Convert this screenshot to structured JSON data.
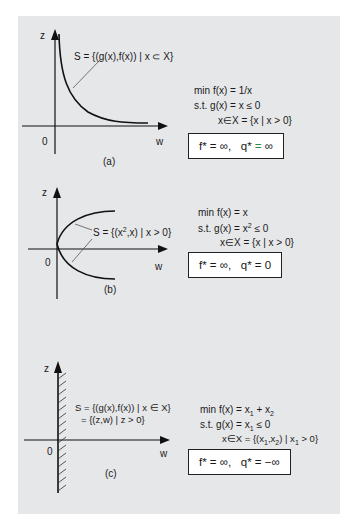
{
  "figure": {
    "background_color": "#e6e7e9",
    "accent_green": "#2e8b3a",
    "panels": [
      {
        "id": "a",
        "caption": "(a)",
        "axis_labels": {
          "vertical": "z",
          "horizontal": "w",
          "origin": "0"
        },
        "set_label": "S = {(g(x),f(x)) | x ⊂ X}",
        "curve": "hyperbola z = 1/w for w > 0",
        "problem": {
          "objective": "min  f(x) = 1/x",
          "constraint": "s.t.  g(x) = x  ≤ 0",
          "domain": "x∈X = {x | x > 0}"
        },
        "result": {
          "f_star": "f* = ∞,",
          "q_star_lhs": "q*",
          "q_star_eq": "=",
          "q_star_val": "∞"
        }
      },
      {
        "id": "b",
        "caption": "(b)",
        "axis_labels": {
          "vertical": "z",
          "horizontal": "w",
          "origin": "0"
        },
        "set_label_prefix": "S = {(x",
        "set_label_sup": "2",
        "set_label_suffix": ",x) | x > 0}",
        "curve": "parabola w = z², both branches",
        "problem": {
          "objective": "min  f(x) = x",
          "constraint_prefix": "s.t.  g(x) = x",
          "constraint_sup": "2",
          "constraint_suffix": " ≤ 0",
          "domain": "x∈X = {x | x > 0}"
        },
        "result": {
          "f_star": "f* = ∞,",
          "q_star": "q* = 0"
        }
      },
      {
        "id": "c",
        "caption": "(c)",
        "axis_labels": {
          "vertical": "z",
          "horizontal": "w",
          "origin": "0"
        },
        "set_label_line1": "S = {(g(x),f(x)) | x ∈ X}",
        "set_label_line2": "= {(z,w) | z > 0}",
        "region": "half-plane, hatched along vertical axis",
        "problem": {
          "objective_prefix": "min  f(x) = x",
          "objective_sub1": "1",
          "objective_mid": " + x",
          "objective_sub2": "2",
          "constraint_prefix": "s.t.  g(x) = x",
          "constraint_sub": "1",
          "constraint_suffix": "  ≤ 0",
          "domain_prefix": "x∈X = {(x",
          "domain_sub1": "1",
          "domain_mid1": ",x",
          "domain_sub2": "2",
          "domain_mid2": ") | x",
          "domain_sub3": "1",
          "domain_suffix": " > 0}"
        },
        "result": {
          "f_star": "f* = ∞,",
          "q_star": "q* = −∞"
        }
      }
    ]
  }
}
